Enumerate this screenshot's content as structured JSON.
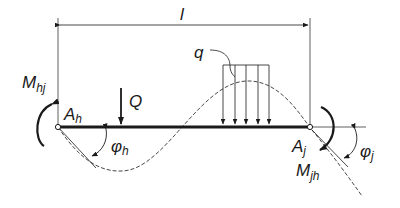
{
  "diagram": {
    "labels": {
      "span": "l",
      "distributed_load": "q",
      "point_load": "Q",
      "left_node": "A",
      "left_node_sub": "h",
      "right_node": "A",
      "right_node_sub": "j",
      "left_moment": "M",
      "left_moment_sub": "hj",
      "right_moment": "M",
      "right_moment_sub": "jh",
      "left_rotation": "φ",
      "left_rotation_sub": "h",
      "right_rotation": "φ",
      "right_rotation_sub": "j"
    },
    "colors": {
      "ink": "#1a1a1a",
      "background": "#ffffff"
    }
  }
}
